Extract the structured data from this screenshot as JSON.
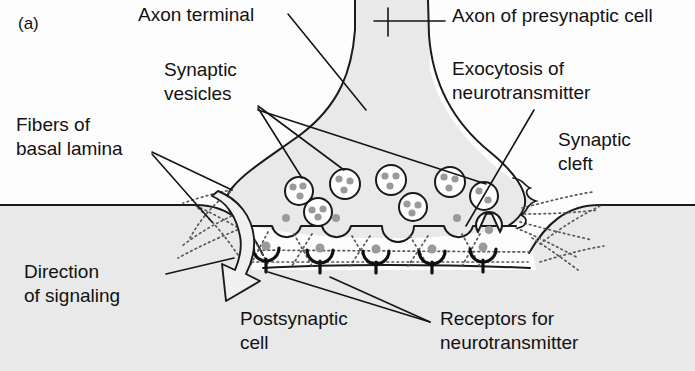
{
  "figure": {
    "panel_label": "(a)",
    "background_color": "#fdfdfd",
    "cell_fill_color": "#e8e8e8",
    "cleft_fill_color": "#ffffff",
    "outline_color": "#1a1a1a",
    "granule_color": "#9a9a9a"
  },
  "labels": {
    "axon_terminal": "Axon terminal",
    "axon_presynaptic": "Axon of presynaptic cell",
    "synaptic_vesicles_l1": "Synaptic",
    "synaptic_vesicles_l2": "vesicles",
    "exocytosis_l1": "Exocytosis of",
    "exocytosis_l2": "neurotransmitter",
    "fibers_l1": "Fibers of",
    "fibers_l2": "basal lamina",
    "synaptic_cleft_l1": "Synaptic",
    "synaptic_cleft_l2": "cleft",
    "direction_l1": "Direction",
    "direction_l2": "of signaling",
    "postsynaptic_l1": "Postsynaptic",
    "postsynaptic_l2": "cell",
    "receptors_l1": "Receptors for",
    "receptors_l2": "neurotransmitter"
  },
  "structures": {
    "vesicles": [
      {
        "cx": 299,
        "cy": 191,
        "r": 14
      },
      {
        "cx": 345,
        "cy": 184,
        "r": 15
      },
      {
        "cx": 318,
        "cy": 212,
        "r": 14
      },
      {
        "cx": 391,
        "cy": 180,
        "r": 15
      },
      {
        "cx": 413,
        "cy": 207,
        "r": 14
      },
      {
        "cx": 450,
        "cy": 182,
        "r": 15
      },
      {
        "cx": 484,
        "cy": 196,
        "r": 14
      }
    ],
    "fusing_vesicles": [
      {
        "cx": 286,
        "cy": 222
      },
      {
        "cx": 336,
        "cy": 222
      },
      {
        "cx": 457,
        "cy": 222
      },
      {
        "cx": 489,
        "cy": 225
      }
    ],
    "receptors": [
      {
        "x": 266,
        "y": 252
      },
      {
        "x": 320,
        "y": 254
      },
      {
        "x": 376,
        "y": 255
      },
      {
        "x": 432,
        "y": 255
      },
      {
        "x": 483,
        "y": 253
      }
    ]
  }
}
